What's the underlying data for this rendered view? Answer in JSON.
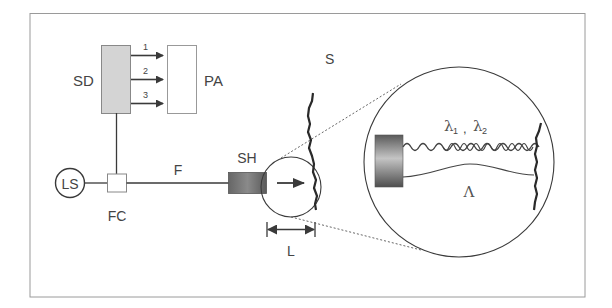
{
  "diagram": {
    "labels": {
      "sd": "SD",
      "pa": "PA",
      "ls": "LS",
      "fc": "FC",
      "f": "F",
      "sh": "SH",
      "s": "S",
      "l": "L",
      "lambda": "λ₁ , λ₂",
      "lambda1": "λ",
      "lambda1_sub": "1",
      "lambda_sep": ",",
      "lambda2": "λ",
      "lambda2_sub": "2",
      "big_lambda": "Λ"
    },
    "channels": [
      {
        "id": "1",
        "label": "1"
      },
      {
        "id": "2",
        "label": "2"
      },
      {
        "id": "3",
        "label": "3"
      }
    ],
    "colors": {
      "frame": "#9a9a9a",
      "stroke": "#3a3a3a",
      "sd_fill": "#d4d4d4",
      "sh_dark": "#555555",
      "sh_light": "#bbbbbb",
      "text": "#444444"
    }
  }
}
